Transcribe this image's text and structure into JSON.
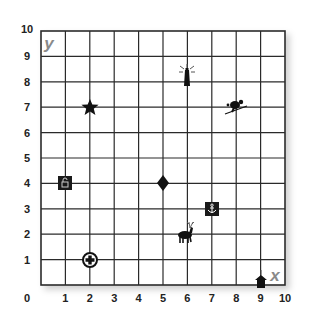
{
  "chart_data": {
    "type": "scatter",
    "title": "",
    "xlabel": "x",
    "ylabel": "y",
    "xlim": [
      0,
      10
    ],
    "ylim": [
      0,
      10
    ],
    "grid": true,
    "x_ticks": [
      "0",
      "1",
      "2",
      "3",
      "4",
      "5",
      "6",
      "7",
      "8",
      "9",
      "10"
    ],
    "y_ticks": [
      "1",
      "2",
      "3",
      "4",
      "5",
      "6",
      "7",
      "8",
      "9",
      "10"
    ],
    "points": [
      {
        "name": "star",
        "x": 2,
        "y": 7
      },
      {
        "name": "lighthouse",
        "x": 6,
        "y": 8
      },
      {
        "name": "skier",
        "x": 8,
        "y": 7
      },
      {
        "name": "padlock",
        "x": 1,
        "y": 4
      },
      {
        "name": "diamond",
        "x": 5,
        "y": 4
      },
      {
        "name": "anchor",
        "x": 7,
        "y": 3
      },
      {
        "name": "deer",
        "x": 6,
        "y": 2
      },
      {
        "name": "first-aid-cross",
        "x": 2,
        "y": 1
      },
      {
        "name": "house",
        "x": 9,
        "y": 0
      }
    ]
  },
  "axes": {
    "origin_label": "0",
    "x_letter": "x",
    "y_letter": "y"
  },
  "colors": {
    "grid_line": "#2a2a2a",
    "marker": "#111111",
    "axis_letter": "#8a8a8a"
  }
}
